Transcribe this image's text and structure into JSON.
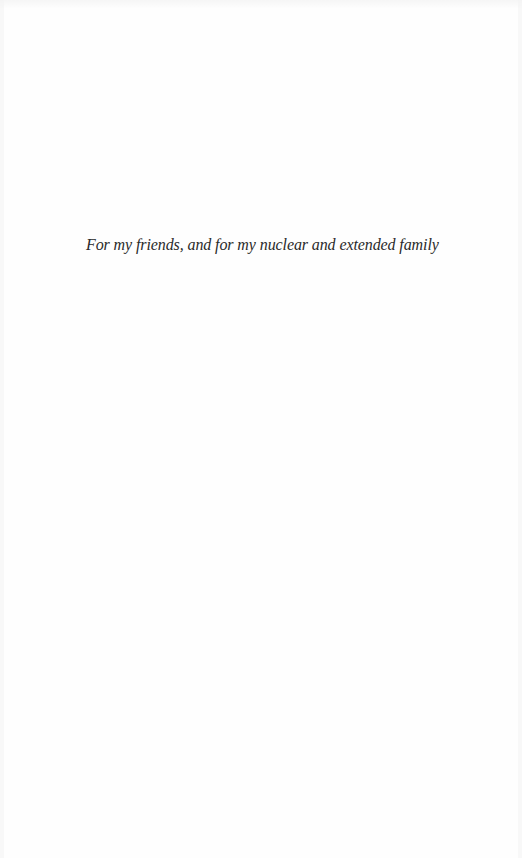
{
  "page": {
    "type": "dedication",
    "dedication_text": "For my friends, and for my nuclear and extended family"
  },
  "colors": {
    "background": "#fefefe",
    "text": "#2a2a2a"
  }
}
